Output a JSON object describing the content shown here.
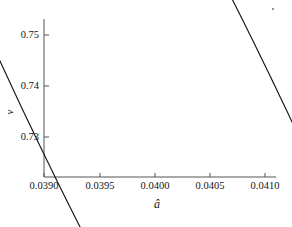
{
  "figure": {
    "background_color": "#ffffff",
    "line_color": "#151515",
    "axis_color": "#555555",
    "text_color": "#131313"
  },
  "axes": {
    "x_title": "â",
    "y_title": "ν",
    "x_ticks": [
      {
        "value": 0.039,
        "label": "0.0390",
        "px": 44
      },
      {
        "value": 0.0395,
        "label": "0.0395",
        "px": 100
      },
      {
        "value": 0.04,
        "label": "0.0400",
        "px": 155
      },
      {
        "value": 0.0405,
        "label": "0.0405",
        "px": 210
      },
      {
        "value": 0.041,
        "label": "0.0410",
        "px": 265
      }
    ],
    "y_ticks": [
      {
        "value": 0.75,
        "label": "0.75",
        "px": 35
      },
      {
        "value": 0.74,
        "label": "0.74",
        "px": 86
      },
      {
        "value": 0.73,
        "label": "0.73",
        "px": 137
      }
    ]
  },
  "marks": {
    "corner_dot": "stray-dot-mark"
  },
  "chart_data": {
    "type": "line",
    "title": "",
    "subtitle": "",
    "xlabel": "â",
    "ylabel": "ν",
    "xlim": [
      0.0389,
      0.0411
    ],
    "ylim": [
      0.7244,
      0.754
    ],
    "grid": false,
    "legend": null,
    "series": [
      {
        "name": "confidence-ellipse",
        "shape": "ellipse",
        "closed": true,
        "center": {
          "x": 0.040005,
          "y": 0.7351
        },
        "semi_major_axis": 0.001075,
        "semi_minor_axis": 0.000317,
        "rotation_deg": 26.0,
        "stroke_color": "#151515",
        "stroke_width": 1.1,
        "fill": "none",
        "extrema": {
          "leftmost": {
            "x": 0.039018,
            "y": 0.72823
          },
          "rightmost": {
            "x": 0.040991,
            "y": 0.75074
          },
          "topmost": {
            "x": 0.040891,
            "y": 0.75226
          },
          "bottommost": {
            "x": 0.039308,
            "y": 0.72488
          }
        },
        "points": [
          {
            "x": 0.040891,
            "y": 0.75226
          },
          {
            "x": 0.0407,
            "y": 0.75197
          },
          {
            "x": 0.04048,
            "y": 0.75138
          },
          {
            "x": 0.0402,
            "y": 0.7503
          },
          {
            "x": 0.0399,
            "y": 0.74872
          },
          {
            "x": 0.03965,
            "y": 0.747
          },
          {
            "x": 0.03942,
            "y": 0.745
          },
          {
            "x": 0.03923,
            "y": 0.7428
          },
          {
            "x": 0.0391,
            "y": 0.7403
          },
          {
            "x": 0.03903,
            "y": 0.7374
          },
          {
            "x": 0.039018,
            "y": 0.7343
          },
          {
            "x": 0.03906,
            "y": 0.7316
          },
          {
            "x": 0.03916,
            "y": 0.729
          },
          {
            "x": 0.039308,
            "y": 0.727
          },
          {
            "x": 0.03952,
            "y": 0.7256
          },
          {
            "x": 0.03978,
            "y": 0.725
          },
          {
            "x": 0.04006,
            "y": 0.7253
          },
          {
            "x": 0.04033,
            "y": 0.7264
          },
          {
            "x": 0.04057,
            "y": 0.7282
          },
          {
            "x": 0.04077,
            "y": 0.7306
          },
          {
            "x": 0.04091,
            "y": 0.7334
          },
          {
            "x": 0.040985,
            "y": 0.7365
          },
          {
            "x": 0.040991,
            "y": 0.7396
          },
          {
            "x": 0.04097,
            "y": 0.743
          },
          {
            "x": 0.04094,
            "y": 0.7468
          },
          {
            "x": 0.04091,
            "y": 0.75
          },
          {
            "x": 0.040891,
            "y": 0.75226
          }
        ]
      }
    ]
  }
}
